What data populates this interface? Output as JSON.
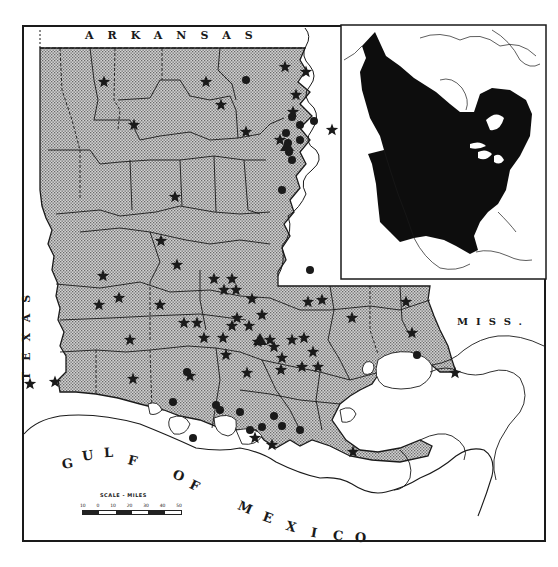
{
  "map": {
    "title_region": "Louisiana",
    "labels": {
      "north": "ARKANSAS",
      "west": "TEXAS",
      "east": "MISS.",
      "gulf_words": [
        "G",
        "U",
        "L",
        "F",
        "O",
        "F",
        "M",
        "E",
        "X",
        "I",
        "C",
        "O"
      ]
    },
    "scale": {
      "title": "SCALE - MILES",
      "ticks": [
        "10",
        "0",
        "10",
        "20",
        "30",
        "40",
        "50"
      ]
    },
    "legend_symbols": {
      "star": "record-star-icon",
      "dot": "record-dot-icon",
      "triangle": "record-triangle-icon"
    },
    "colors": {
      "land_stipple": "#b9b9b9",
      "ink": "#1a1a1a",
      "water": "#ffffff",
      "range_fill": "#0d0d0d"
    },
    "inset": {
      "name": "North America range inset",
      "range_fill": "#0d0d0d"
    },
    "stars": [
      [
        104,
        82
      ],
      [
        206,
        82
      ],
      [
        134,
        125
      ],
      [
        221,
        105
      ],
      [
        285,
        67
      ],
      [
        246,
        132
      ],
      [
        306,
        72
      ],
      [
        296,
        95
      ],
      [
        293,
        112
      ],
      [
        280,
        140
      ],
      [
        332,
        130
      ],
      [
        175,
        197
      ],
      [
        161,
        241
      ],
      [
        103,
        276
      ],
      [
        177,
        265
      ],
      [
        99,
        305
      ],
      [
        119,
        298
      ],
      [
        160,
        305
      ],
      [
        214,
        279
      ],
      [
        232,
        279
      ],
      [
        224,
        290
      ],
      [
        236,
        290
      ],
      [
        130,
        340
      ],
      [
        184,
        323
      ],
      [
        197,
        323
      ],
      [
        204,
        338
      ],
      [
        252,
        299
      ],
      [
        262,
        315
      ],
      [
        249,
        326
      ],
      [
        232,
        326
      ],
      [
        237,
        318
      ],
      [
        223,
        338
      ],
      [
        226,
        355
      ],
      [
        258,
        342
      ],
      [
        270,
        340
      ],
      [
        282,
        358
      ],
      [
        292,
        340
      ],
      [
        308,
        302
      ],
      [
        322,
        300
      ],
      [
        352,
        318
      ],
      [
        406,
        302
      ],
      [
        412,
        333
      ],
      [
        304,
        338
      ],
      [
        313,
        352
      ],
      [
        318,
        367
      ],
      [
        247,
        373
      ],
      [
        190,
        376
      ],
      [
        133,
        379
      ],
      [
        281,
        370
      ],
      [
        274,
        347
      ],
      [
        255,
        438
      ],
      [
        302,
        367
      ],
      [
        353,
        452
      ],
      [
        455,
        373
      ],
      [
        55,
        382
      ],
      [
        30,
        384
      ],
      [
        272,
        445
      ]
    ],
    "dots": [
      [
        246,
        80
      ],
      [
        292,
        117
      ],
      [
        300,
        125
      ],
      [
        314,
        121
      ],
      [
        286,
        133
      ],
      [
        288,
        143
      ],
      [
        289,
        152
      ],
      [
        300,
        140
      ],
      [
        292,
        160
      ],
      [
        282,
        190
      ],
      [
        310,
        270
      ],
      [
        187,
        372
      ],
      [
        216,
        405
      ],
      [
        220,
        410
      ],
      [
        240,
        412
      ],
      [
        250,
        430
      ],
      [
        262,
        427
      ],
      [
        274,
        416
      ],
      [
        282,
        426
      ],
      [
        300,
        430
      ],
      [
        193,
        438
      ],
      [
        173,
        402
      ],
      [
        417,
        355
      ]
    ],
    "triangles": [
      [
        287,
        146
      ],
      [
        260,
        340
      ]
    ]
  }
}
